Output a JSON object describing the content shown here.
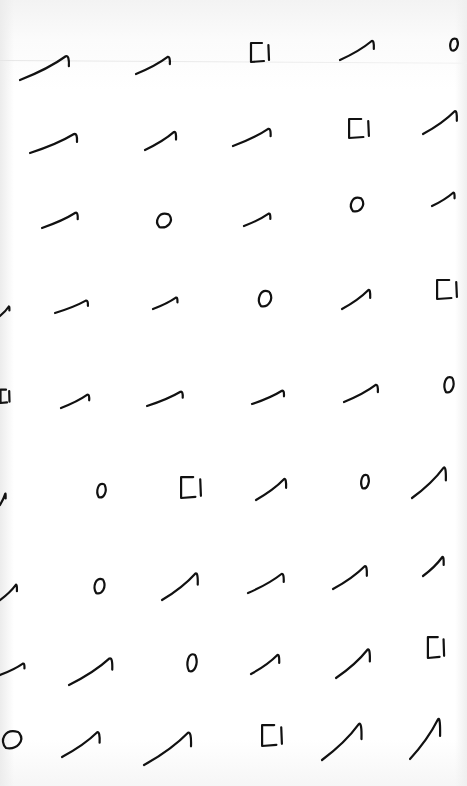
{
  "sheet": {
    "description": "Scanned sheet of hand-drawn stroke glyphs arranged in a grid",
    "ink_color": "#111111",
    "paper_color": "#ffffff",
    "glyph_types": [
      "hook",
      "circle",
      "square"
    ],
    "glyphs": [
      {
        "type": "hook",
        "x": 20,
        "y": 55,
        "w": 52,
        "h": 25
      },
      {
        "type": "hook",
        "x": 136,
        "y": 56,
        "w": 36,
        "h": 18
      },
      {
        "type": "square",
        "x": 250,
        "y": 42,
        "w": 20,
        "h": 20
      },
      {
        "type": "hook",
        "x": 340,
        "y": 40,
        "w": 36,
        "h": 20
      },
      {
        "type": "circle",
        "x": 449,
        "y": 37,
        "w": 10,
        "h": 14
      },
      {
        "type": "hook",
        "x": 30,
        "y": 133,
        "w": 50,
        "h": 20
      },
      {
        "type": "hook",
        "x": 145,
        "y": 131,
        "w": 33,
        "h": 19
      },
      {
        "type": "hook",
        "x": 233,
        "y": 128,
        "w": 40,
        "h": 18
      },
      {
        "type": "square",
        "x": 348,
        "y": 118,
        "w": 22,
        "h": 20
      },
      {
        "type": "hook",
        "x": 423,
        "y": 110,
        "w": 36,
        "h": 24
      },
      {
        "type": "hook",
        "x": 42,
        "y": 212,
        "w": 38,
        "h": 16
      },
      {
        "type": "circle",
        "x": 155,
        "y": 212,
        "w": 18,
        "h": 16
      },
      {
        "type": "hook",
        "x": 244,
        "y": 212,
        "w": 28,
        "h": 13
      },
      {
        "type": "circle",
        "x": 349,
        "y": 196,
        "w": 16,
        "h": 16
      },
      {
        "type": "hook",
        "x": 432,
        "y": 192,
        "w": 24,
        "h": 14
      },
      {
        "type": "hook",
        "x": 0,
        "y": 302,
        "w": 10,
        "h": 10
      },
      {
        "type": "hook",
        "x": 55,
        "y": 299,
        "w": 35,
        "h": 13
      },
      {
        "type": "hook",
        "x": 153,
        "y": 295,
        "w": 26,
        "h": 12
      },
      {
        "type": "circle",
        "x": 257,
        "y": 289,
        "w": 16,
        "h": 18
      },
      {
        "type": "hook",
        "x": 342,
        "y": 289,
        "w": 30,
        "h": 20
      },
      {
        "type": "square",
        "x": 436,
        "y": 279,
        "w": 22,
        "h": 20
      },
      {
        "type": "square",
        "x": 0,
        "y": 389,
        "w": 10,
        "h": 14
      },
      {
        "type": "hook",
        "x": 61,
        "y": 394,
        "w": 30,
        "h": 14
      },
      {
        "type": "hook",
        "x": 147,
        "y": 391,
        "w": 38,
        "h": 15
      },
      {
        "type": "hook",
        "x": 252,
        "y": 390,
        "w": 34,
        "h": 14
      },
      {
        "type": "hook",
        "x": 344,
        "y": 384,
        "w": 36,
        "h": 18
      },
      {
        "type": "circle",
        "x": 443,
        "y": 375,
        "w": 12,
        "h": 18
      },
      {
        "type": "hook",
        "x": 0,
        "y": 491,
        "w": 6,
        "h": 12
      },
      {
        "type": "circle",
        "x": 96,
        "y": 482,
        "w": 11,
        "h": 16
      },
      {
        "type": "square",
        "x": 180,
        "y": 476,
        "w": 22,
        "h": 22
      },
      {
        "type": "hook",
        "x": 256,
        "y": 478,
        "w": 32,
        "h": 22
      },
      {
        "type": "circle",
        "x": 360,
        "y": 473,
        "w": 10,
        "h": 16
      },
      {
        "type": "hook",
        "x": 412,
        "y": 466,
        "w": 36,
        "h": 32
      },
      {
        "type": "hook",
        "x": 0,
        "y": 584,
        "w": 18,
        "h": 16
      },
      {
        "type": "circle",
        "x": 93,
        "y": 577,
        "w": 13,
        "h": 17
      },
      {
        "type": "hook",
        "x": 162,
        "y": 572,
        "w": 38,
        "h": 28
      },
      {
        "type": "hook",
        "x": 248,
        "y": 573,
        "w": 38,
        "h": 20
      },
      {
        "type": "hook",
        "x": 333,
        "y": 565,
        "w": 36,
        "h": 24
      },
      {
        "type": "hook",
        "x": 423,
        "y": 556,
        "w": 22,
        "h": 20
      },
      {
        "type": "hook",
        "x": 0,
        "y": 661,
        "w": 26,
        "h": 12
      },
      {
        "type": "hook",
        "x": 69,
        "y": 657,
        "w": 46,
        "h": 28
      },
      {
        "type": "circle",
        "x": 186,
        "y": 652,
        "w": 12,
        "h": 20
      },
      {
        "type": "hook",
        "x": 251,
        "y": 654,
        "w": 30,
        "h": 20
      },
      {
        "type": "hook",
        "x": 336,
        "y": 648,
        "w": 36,
        "h": 30
      },
      {
        "type": "square",
        "x": 427,
        "y": 636,
        "w": 18,
        "h": 22
      },
      {
        "type": "circle",
        "x": 0,
        "y": 729,
        "w": 24,
        "h": 20
      },
      {
        "type": "hook",
        "x": 62,
        "y": 731,
        "w": 40,
        "h": 26
      },
      {
        "type": "hook",
        "x": 144,
        "y": 731,
        "w": 50,
        "h": 34
      },
      {
        "type": "square",
        "x": 261,
        "y": 724,
        "w": 22,
        "h": 22
      },
      {
        "type": "hook",
        "x": 322,
        "y": 722,
        "w": 42,
        "h": 38
      },
      {
        "type": "hook",
        "x": 410,
        "y": 717,
        "w": 32,
        "h": 42
      }
    ]
  }
}
